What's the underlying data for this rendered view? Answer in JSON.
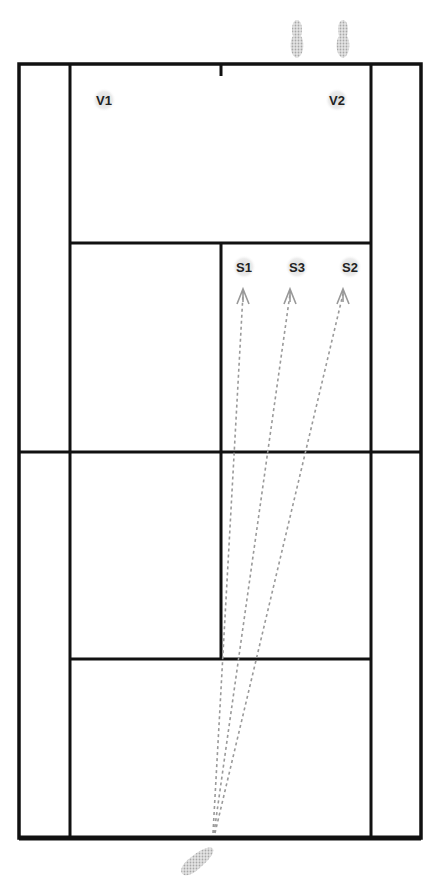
{
  "diagram": {
    "type": "tennis-court-serve-targets",
    "colors": {
      "line": "#111111",
      "marker": "#c8c8c8",
      "arrow": "#9a9a9a",
      "label": "#222222"
    },
    "players": [
      {
        "id": "V1",
        "label": "V1",
        "x": 104,
        "y": 100
      },
      {
        "id": "V2",
        "label": "V2",
        "x": 337,
        "y": 100
      }
    ],
    "targets": [
      {
        "id": "S1",
        "label": "S1",
        "x": 244,
        "y": 268,
        "arrow_x": 243,
        "arrow_y": 292
      },
      {
        "id": "S3",
        "label": "S3",
        "x": 297,
        "y": 268,
        "arrow_x": 290,
        "arrow_y": 292
      },
      {
        "id": "S2",
        "label": "S2",
        "x": 350,
        "y": 268,
        "arrow_x": 343,
        "arrow_y": 292
      }
    ],
    "server_origin": {
      "x": 213,
      "y": 833
    }
  }
}
